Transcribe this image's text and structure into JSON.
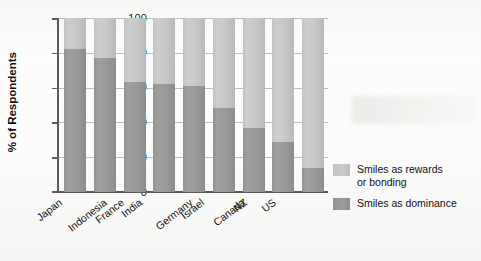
{
  "chart_data": {
    "type": "bar",
    "subtype": "stacked-100-percent",
    "title": "",
    "xlabel": "",
    "ylabel": "% of Respondents",
    "ylim": [
      0,
      100
    ],
    "yticks": [
      0,
      20,
      40,
      60,
      80,
      100
    ],
    "ytick_labels": [
      "0",
      "20",
      "40",
      "60",
      "80",
      "100"
    ],
    "grid": true,
    "grid_axis": "y",
    "legend_position": "right",
    "categories": [
      "Japan",
      "Indonesia",
      "France",
      "India",
      "Germany",
      "Israel",
      "Canada",
      "NZ",
      "US"
    ],
    "series": [
      {
        "name": "Smiles as dominance",
        "color": "#9a9a9a",
        "values": [
          82,
          77,
          63,
          62,
          61,
          48,
          37,
          29,
          14
        ]
      },
      {
        "name": "Smiles as rewards or bonding",
        "color": "#c8c8c8",
        "values": [
          18,
          23,
          37,
          38,
          39,
          52,
          63,
          71,
          86
        ]
      }
    ],
    "legend_entries": [
      {
        "label_line1": "Smiles as rewards",
        "label_line2": "or bonding",
        "swatch": "light"
      },
      {
        "label_line1": "Smiles as dominance",
        "label_line2": "",
        "swatch": "dark"
      }
    ]
  },
  "axis": {
    "y_title": "% of Respondents",
    "y_tick_0": "0",
    "y_tick_20": "20",
    "y_tick_40": "40",
    "y_tick_60": "60",
    "y_tick_80": "80",
    "y_tick_100": "100"
  },
  "x_labels": {
    "c0": "Japan",
    "c1": "Indonesia",
    "c2": "France",
    "c3": "India",
    "c4": "Germany",
    "c5": "Israel",
    "c6": "Canada",
    "c7": "NZ",
    "c8": "US"
  },
  "legend": {
    "rewards_line1": "Smiles as rewards",
    "rewards_line2": "or bonding",
    "dominance_line1": "Smiles as dominance"
  },
  "colors": {
    "light_segment": "#c8c8c8",
    "dark_segment": "#9a9a9a",
    "axis": "#5a5a5a",
    "text": "#111111",
    "background": "#fdfdfd"
  }
}
